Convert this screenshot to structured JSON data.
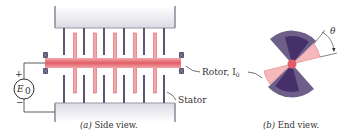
{
  "figure": {
    "side_view": {
      "caption_prefix": "(a)",
      "caption_text": " Side view.",
      "labels": {
        "rotor": "Rotor, I",
        "rotor_sub": "0",
        "stator": "Stator",
        "source": "E",
        "source_sub": "0",
        "plus": "+",
        "minus": "−"
      }
    },
    "end_view": {
      "caption_prefix": "(b)",
      "caption_text": " End view.",
      "angle_label": "θ"
    },
    "colors": {
      "stator_block": "#e4e3ea",
      "stator_edge": "#8a8798",
      "stator_plate": "#5c5670",
      "rotor": "#e8737b",
      "rotor_light": "#f5b8bb",
      "insulator": "#5a5270",
      "sector_outer": "#6e5f8a",
      "sector_inner": "#45306a",
      "wire": "#333333"
    }
  }
}
